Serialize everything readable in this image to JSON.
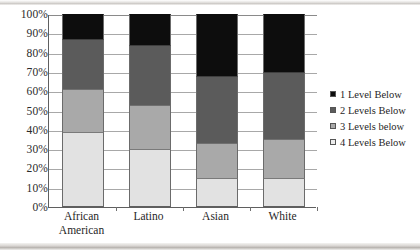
{
  "chart_data": {
    "type": "bar",
    "subtype": "stacked-100-percent",
    "title": "",
    "xlabel": "",
    "ylabel": "",
    "categories": [
      "African American",
      "Latino",
      "Asian",
      "White"
    ],
    "category_lines": [
      [
        "African",
        "American"
      ],
      [
        "Latino"
      ],
      [
        "Asian"
      ],
      [
        "White"
      ]
    ],
    "series": [
      {
        "name": "1 Level Below",
        "color": "#0d0d0d",
        "values": [
          13,
          16,
          32,
          30
        ]
      },
      {
        "name": "2 Levels Below",
        "color": "#5b5b5b",
        "values": [
          26,
          31,
          35,
          35
        ]
      },
      {
        "name": "3 Levels below",
        "color": "#a9a9a9",
        "values": [
          22,
          23,
          18,
          20
        ]
      },
      {
        "name": "4 Levels Below",
        "color": "#e2e2e2",
        "values": [
          39,
          30,
          15,
          15
        ]
      }
    ],
    "cumulative_tops": {
      "African American": [
        100,
        87,
        61,
        39
      ],
      "Latino": [
        100,
        84,
        53,
        30
      ],
      "Asian": [
        100,
        68,
        33,
        15
      ],
      "White": [
        100,
        70,
        35,
        15
      ]
    },
    "ylim": [
      0,
      100
    ],
    "ytick_values": [
      0,
      10,
      20,
      30,
      40,
      50,
      60,
      70,
      80,
      90,
      100
    ],
    "ytick_labels": [
      "0%",
      "10%",
      "20%",
      "30%",
      "40%",
      "50%",
      "60%",
      "70%",
      "80%",
      "90%",
      "100%"
    ],
    "grid": true,
    "grid_axis": "y",
    "legend_position": "right",
    "legend_entries": [
      "1 Level Below",
      "2 Levels Below",
      "3 Levels below",
      "4 Levels Below"
    ]
  }
}
